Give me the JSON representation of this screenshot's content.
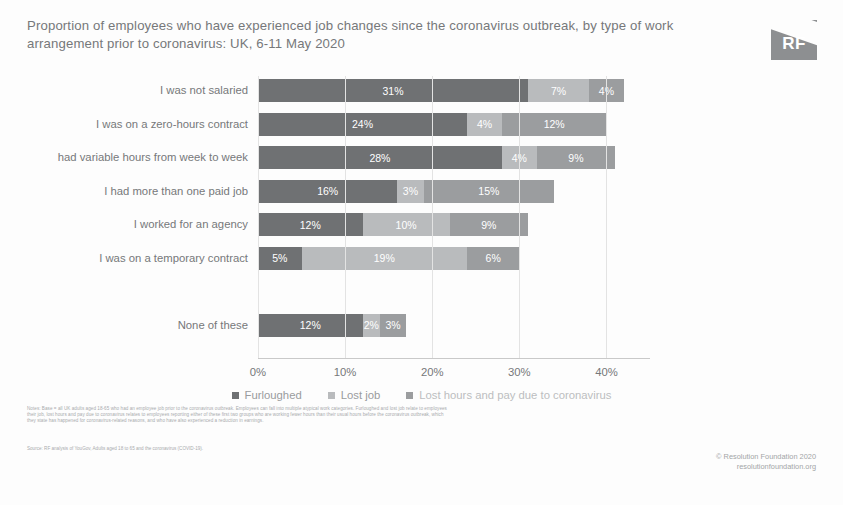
{
  "header": {
    "title": "Proportion of employees who have experienced job changes since the coronavirus outbreak, by type of work arrangement prior to coronavirus: UK, 6-11 May 2020",
    "logo_text": "RF",
    "logo_name": "resolution-foundation-logo"
  },
  "footer": {
    "notes": "Notes: Base = all UK adults aged 18-65 who had an employee job prior to the coronavirus outbreak. Employees can fall into multiple atypical work categories. Furloughed and lost job relate to employees their job, lost hours and pay due to coronavirus relates to employees reporting either of these first two groups who are working fewer hours than their usual hours before the coronavirus outbreak, which they state has happened for coronavirus-related reasons, and who have also experienced a reduction in earnings.",
    "source": "Source: RF analysis of YouGov, Adults aged 18 to 65 and the coronavirus (COVID-19).",
    "credit_line1": "© Resolution Foundation 2020",
    "credit_line2": "resolutionfoundation.org"
  },
  "chart_data": {
    "type": "bar",
    "orientation": "horizontal",
    "stacked": true,
    "title": "Proportion of employees who have experienced job changes since the coronavirus outbreak, by type of work arrangement prior to coronavirus: UK, 6-11 May 2020",
    "xlabel": "",
    "ylabel": "",
    "xlim": [
      0,
      45
    ],
    "xticks": [
      "0%",
      "10%",
      "20%",
      "30%",
      "40%"
    ],
    "xtick_values": [
      0,
      10,
      20,
      30,
      40
    ],
    "grid": true,
    "legend_position": "bottom",
    "categories": [
      "I was not salaried",
      "I was on a zero-hours contract",
      "had variable hours from week to week",
      "I had more than one paid job",
      "I worked for an agency",
      "I was on a temporary contract",
      "",
      "None of these"
    ],
    "series": [
      {
        "name": "Furloughed",
        "color": "#6f7173",
        "values": [
          31,
          24,
          28,
          16,
          12,
          5,
          null,
          12
        ]
      },
      {
        "name": "Lost job",
        "color": "#b9bbbd",
        "values": [
          7,
          4,
          4,
          3,
          10,
          19,
          null,
          2
        ]
      },
      {
        "name": "Lost hours and pay due to coronavirus",
        "color": "#9b9d9f",
        "values": [
          4,
          12,
          9,
          15,
          9,
          6,
          null,
          3
        ]
      }
    ],
    "data_labels": [
      [
        "31%",
        "7%",
        "4%"
      ],
      [
        "24%",
        "4%",
        "12%"
      ],
      [
        "28%",
        "4%",
        "9%"
      ],
      [
        "16%",
        "3%",
        "15%"
      ],
      [
        "12%",
        "10%",
        "9%"
      ],
      [
        "5%",
        "19%",
        "6%"
      ],
      [],
      [
        "12%",
        "2%",
        "3%"
      ]
    ]
  }
}
